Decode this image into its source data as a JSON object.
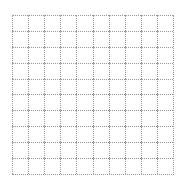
{
  "grid": {
    "rows": 10,
    "columns": 10,
    "line_color": "#9a9a9a",
    "line_style": "dotted",
    "background": "#ffffff"
  }
}
